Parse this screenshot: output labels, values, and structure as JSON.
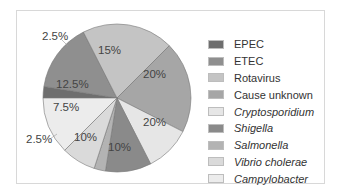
{
  "chart_data": {
    "type": "pie",
    "title": "",
    "legend_position": "right",
    "slices": [
      {
        "label": "EPEC",
        "value": 2.5,
        "display": "2.5%",
        "color": "#6e6e6e",
        "italic": false
      },
      {
        "label": "ETEC",
        "value": 15,
        "display": "15%",
        "color": "#8f8f8f",
        "italic": false
      },
      {
        "label": "Rotavirus",
        "value": 20,
        "display": "20%",
        "color": "#c4c4c4",
        "italic": false
      },
      {
        "label": "Cause unknown",
        "value": 20,
        "display": "20%",
        "color": "#a6a6a6",
        "italic": false
      },
      {
        "label": "Cryptosporidium",
        "value": 10,
        "display": "10%",
        "color": "#e6e6e6",
        "italic": true
      },
      {
        "label": "Shigella",
        "value": 10,
        "display": "10%",
        "color": "#8a8a8a",
        "italic": true
      },
      {
        "label": "Salmonella",
        "value": 2.5,
        "display": "2.5%",
        "color": "#b3b3b3",
        "italic": true
      },
      {
        "label": "Vibrio cholerae",
        "value": 7.5,
        "display": "7.5%",
        "color": "#dadada",
        "italic": true
      },
      {
        "label": "Campylobacter",
        "value": 12.5,
        "display": "12.5%",
        "color": "#ececec",
        "italic": true
      }
    ]
  },
  "labels": {
    "epec": "2.5%",
    "etec": "15%",
    "rotavirus": "20%",
    "unknown": "20%",
    "crypto": "10%",
    "shigella": "10%",
    "salmonella": "2.5%",
    "vibrio": "7.5%",
    "campylo": "12.5%"
  },
  "legend": [
    {
      "label": "EPEC"
    },
    {
      "label": "ETEC"
    },
    {
      "label": "Rotavirus"
    },
    {
      "label": "Cause unknown"
    },
    {
      "label": "Cryptosporidium"
    },
    {
      "label": "Shigella"
    },
    {
      "label": "Salmonella"
    },
    {
      "label": "Vibrio cholerae"
    },
    {
      "label": "Campylobacter"
    }
  ]
}
